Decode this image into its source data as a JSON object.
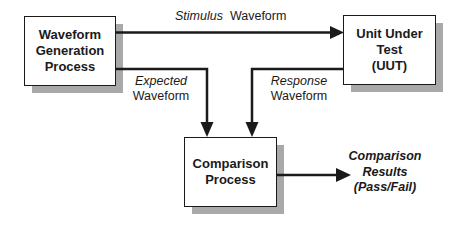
{
  "diagram": {
    "type": "flow",
    "nodes": [
      {
        "id": "wgp",
        "lines": [
          "Waveform",
          "Generation",
          "Process"
        ]
      },
      {
        "id": "uut",
        "lines": [
          "Unit Under",
          "Test",
          "(UUT)"
        ]
      },
      {
        "id": "cmp",
        "lines": [
          "Comparison",
          "Process"
        ]
      }
    ],
    "edges": [
      {
        "from": "wgp",
        "to": "uut",
        "label_italic": "Stimulus",
        "label_plain": "Waveform"
      },
      {
        "from": "wgp",
        "to": "cmp",
        "label_italic": "Expected",
        "label_plain": "Waveform"
      },
      {
        "from": "uut",
        "to": "cmp",
        "label_italic": "Response",
        "label_plain": "Waveform"
      },
      {
        "from": "cmp",
        "to": "output",
        "label": "Comparison Results (Pass/Fail)"
      }
    ],
    "output": {
      "lines": [
        "Comparison",
        "Results",
        "(Pass/Fail)"
      ]
    },
    "colors": {
      "line": "#1a1a1a",
      "shadow": "#a9a9a9",
      "box_fill": "#ffffff"
    }
  }
}
